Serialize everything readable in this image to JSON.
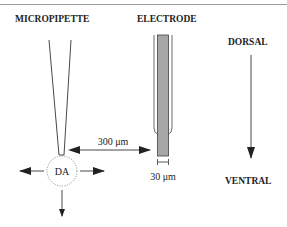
{
  "diagram": {
    "labels": {
      "micropipette": "MICROPIPETTE",
      "electrode": "ELECTRODE",
      "dorsal": "DORSAL",
      "ventral": "VENTRAL",
      "substance": "DA",
      "distance": "300 μm",
      "electrode_width": "30 μm"
    },
    "colors": {
      "line": "#333333",
      "electrode_core": "#a6a6a6",
      "top_rule": "#9a9a9a"
    },
    "arrows": [
      "left",
      "right",
      "down",
      "distance-bidirectional",
      "dorsal-to-ventral"
    ]
  }
}
